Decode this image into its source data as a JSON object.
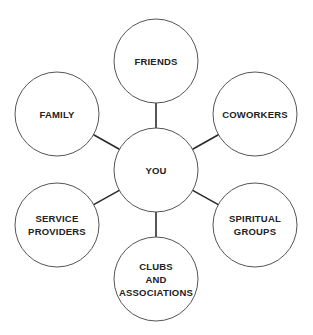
{
  "diagram": {
    "type": "hub-and-spoke",
    "center": {
      "id": "you",
      "label": [
        "YOU"
      ],
      "cx": 156,
      "cy": 170,
      "r": 42
    },
    "nodes": [
      {
        "id": "friends",
        "label": [
          "FRIENDS"
        ],
        "cx": 156,
        "cy": 61,
        "r": 42
      },
      {
        "id": "family",
        "label": [
          "FAMILY"
        ],
        "cx": 57,
        "cy": 114,
        "r": 42
      },
      {
        "id": "coworkers",
        "label": [
          "COWORKERS"
        ],
        "cx": 255,
        "cy": 114,
        "r": 42
      },
      {
        "id": "service-providers",
        "label": [
          "SERVICE",
          "PROVIDERS"
        ],
        "cx": 57,
        "cy": 225,
        "r": 42
      },
      {
        "id": "spiritual-groups",
        "label": [
          "SPIRITUAL",
          "GROUPS"
        ],
        "cx": 255,
        "cy": 225,
        "r": 42
      },
      {
        "id": "clubs-and-associations",
        "label": [
          "CLUBS",
          "AND",
          "ASSOCIATIONS"
        ],
        "cx": 156,
        "cy": 279,
        "r": 42
      }
    ],
    "edges": [
      {
        "from": "you",
        "to": "friends"
      },
      {
        "from": "you",
        "to": "family"
      },
      {
        "from": "you",
        "to": "coworkers"
      },
      {
        "from": "you",
        "to": "service-providers"
      },
      {
        "from": "you",
        "to": "spiritual-groups"
      },
      {
        "from": "you",
        "to": "clubs-and-associations"
      }
    ],
    "colors": {
      "background": "#ffffff",
      "circle_stroke": "#555555",
      "edge_stroke": "#2a2a2a",
      "text": "#222222"
    }
  }
}
